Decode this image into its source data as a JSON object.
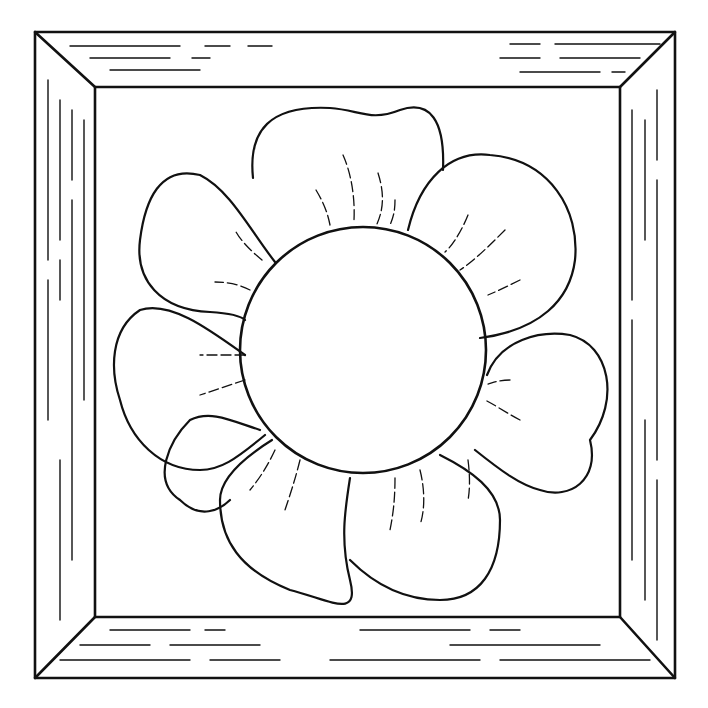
{
  "artwork": {
    "title": "",
    "subject": "flower-in-wooden-frame",
    "style": "line-art coloring page",
    "colors": {
      "ink": "#111111",
      "paper": "#ffffff"
    },
    "frame": {
      "outer": [
        35,
        32,
        675,
        678
      ],
      "inner": [
        95,
        87,
        620,
        617
      ]
    },
    "flower": {
      "center": [
        363,
        350
      ],
      "center_radius": 123,
      "petal_count": 8
    }
  }
}
